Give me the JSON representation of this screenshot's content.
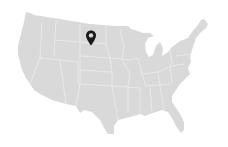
{
  "map": {
    "region": "United States (contiguous)",
    "fill_color": "#d9d9d9",
    "border_color": "#efefef",
    "background_color": "#ffffff"
  },
  "marker": {
    "icon": "map-pin-icon",
    "color": "#1a1a1a",
    "location_hint": "North Dakota / northern plains",
    "x": 91,
    "y": 38
  }
}
